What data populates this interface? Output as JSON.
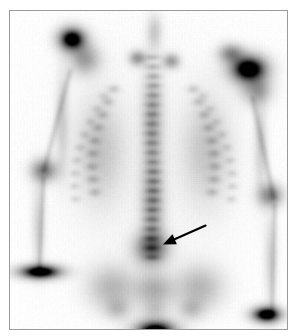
{
  "figure": {
    "modality": "Nuclear medicine bone scan",
    "view": "Posterior",
    "colormap": "grayscale-inverted",
    "background_color": "#ffffff",
    "frame_color": "#9a9a9a",
    "annotation_color": "#000000"
  },
  "annotations": [
    {
      "name": "lesion-arrow",
      "type": "arrow",
      "color": "#000000",
      "tail_x": 206,
      "tail_y": 226,
      "tip_x": 163,
      "tip_y": 245,
      "points_to": "focal-increased-uptake-lower-lumbar-spine"
    }
  ],
  "chart_data": {
    "type": "heatmap",
    "xlabel": "",
    "ylabel": "",
    "grid": false,
    "legend": "none",
    "colormap": "grayscale-inverted",
    "intensity_scale": {
      "min_label": "low uptake",
      "max_label": "high uptake",
      "min": 0,
      "max": 100
    },
    "xlim": [
      0,
      279
    ],
    "ylim": [
      0,
      320
    ],
    "regions": [
      {
        "label": "Right shoulder / acromioclavicular",
        "x": 62,
        "y": 28,
        "rx": 15,
        "ry": 13,
        "intensity": 88
      },
      {
        "label": "Right scapula",
        "x": 75,
        "y": 48,
        "rx": 16,
        "ry": 16,
        "intensity": 42
      },
      {
        "label": "Left shoulder / glenohumeral",
        "x": 240,
        "y": 58,
        "rx": 20,
        "ry": 15,
        "intensity": 96
      },
      {
        "label": "Left acromion",
        "x": 222,
        "y": 42,
        "rx": 13,
        "ry": 10,
        "intensity": 48
      },
      {
        "label": "Left scapula",
        "x": 248,
        "y": 80,
        "rx": 16,
        "ry": 14,
        "intensity": 40
      },
      {
        "label": "Right sternoclavicular",
        "x": 128,
        "y": 47,
        "rx": 9,
        "ry": 8,
        "intensity": 45
      },
      {
        "label": "Left sternoclavicular",
        "x": 162,
        "y": 50,
        "rx": 9,
        "ry": 8,
        "intensity": 42
      },
      {
        "label": "Cervicothoracic junction",
        "x": 145,
        "y": 20,
        "rx": 8,
        "ry": 18,
        "intensity": 22
      },
      {
        "label": "Thoracic spine",
        "x": 143,
        "y": 110,
        "rx": 11,
        "ry": 55,
        "intensity": 36
      },
      {
        "label": "Lumbar spine",
        "x": 143,
        "y": 195,
        "rx": 12,
        "ry": 45,
        "intensity": 40
      },
      {
        "label": "Lower lumbar focal lesion (arrowed)",
        "x": 142,
        "y": 238,
        "rx": 18,
        "ry": 17,
        "intensity": 62
      },
      {
        "label": "Sacrum",
        "x": 145,
        "y": 280,
        "rx": 20,
        "ry": 18,
        "intensity": 34
      },
      {
        "label": "Right iliac wing",
        "x": 102,
        "y": 278,
        "rx": 26,
        "ry": 24,
        "intensity": 32
      },
      {
        "label": "Left iliac wing",
        "x": 190,
        "y": 278,
        "rx": 26,
        "ry": 24,
        "intensity": 32
      },
      {
        "label": "Urinary bladder",
        "x": 146,
        "y": 322,
        "rx": 22,
        "ry": 12,
        "intensity": 99
      },
      {
        "label": "Right humerus",
        "x": 52,
        "y": 110,
        "rx": 7,
        "ry": 50,
        "intensity": 20
      },
      {
        "label": "Right elbow",
        "x": 34,
        "y": 160,
        "rx": 14,
        "ry": 12,
        "intensity": 55
      },
      {
        "label": "Right forearm",
        "x": 28,
        "y": 215,
        "rx": 7,
        "ry": 45,
        "intensity": 18
      },
      {
        "label": "Right wrist / hand",
        "x": 30,
        "y": 262,
        "rx": 23,
        "ry": 8,
        "intensity": 92
      },
      {
        "label": "Left humerus",
        "x": 252,
        "y": 135,
        "rx": 7,
        "ry": 50,
        "intensity": 20
      },
      {
        "label": "Left elbow",
        "x": 262,
        "y": 185,
        "rx": 13,
        "ry": 12,
        "intensity": 52
      },
      {
        "label": "Left forearm",
        "x": 262,
        "y": 250,
        "rx": 7,
        "ry": 48,
        "intensity": 18
      },
      {
        "label": "Left wrist / hand",
        "x": 258,
        "y": 305,
        "rx": 16,
        "ry": 9,
        "intensity": 90
      },
      {
        "label": "Right ribs",
        "x": 90,
        "y": 140,
        "rx": 26,
        "ry": 55,
        "intensity": 24
      },
      {
        "label": "Left ribs",
        "x": 198,
        "y": 140,
        "rx": 26,
        "ry": 55,
        "intensity": 24
      }
    ]
  }
}
